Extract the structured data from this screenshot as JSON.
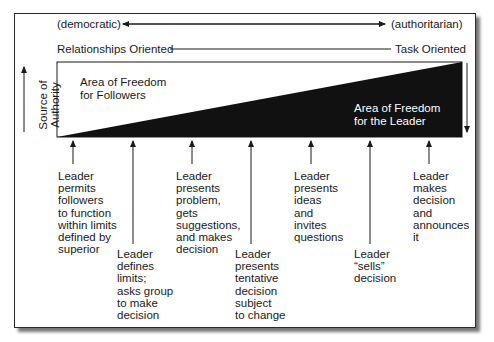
{
  "diagram": {
    "top_scale": {
      "left_label": "(democratic)",
      "right_label": "(authoritarian)"
    },
    "orientation_scale": {
      "left_label": "Relationships Oriented",
      "right_label": "Task Oriented"
    },
    "source_of_authority_label": "Source of\nAuthority",
    "followers_area_label": "Area of Freedom\nfor Followers",
    "leader_area_label": "Area of Freedom\nfor the Leader",
    "colors": {
      "leader_area": "#111111",
      "followers_area": "#ffffff",
      "text": "#1a1a1a"
    },
    "behaviors": [
      {
        "text": "Leader\npermits\nfollowers\nto function\nwithin limits\ndefined by\nsuperior",
        "row": "upper"
      },
      {
        "text": "Leader\ndefines\nlimits;\nasks group\nto make\ndecision",
        "row": "lower"
      },
      {
        "text": "Leader\npresents\nproblem,\ngets\nsuggestions,\nand makes\ndecision",
        "row": "upper"
      },
      {
        "text": "Leader\npresents\ntentative\ndecision\nsubject\nto change",
        "row": "lower"
      },
      {
        "text": "Leader\npresents\nideas\nand\ninvites\nquestions",
        "row": "upper"
      },
      {
        "text": "Leader\n“sells”\ndecision",
        "row": "lower"
      },
      {
        "text": "Leader\nmakes\ndecision\nand\nannounces\nit",
        "row": "upper"
      }
    ]
  }
}
